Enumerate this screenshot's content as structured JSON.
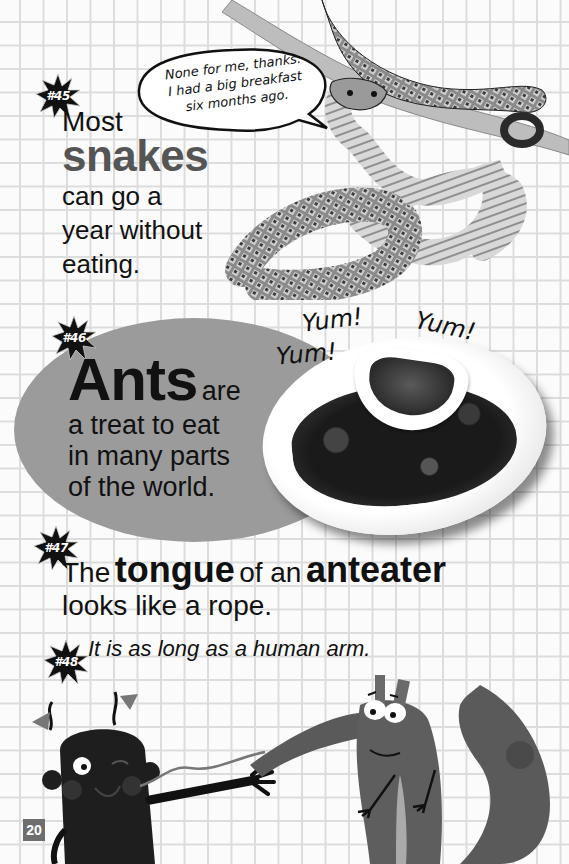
{
  "page": {
    "number": "20",
    "background": "grid-paper",
    "colors": {
      "grid_line": "#dcdcdc",
      "highlight_gray": "#555555",
      "ellipse_gray": "#9b9b9b",
      "badge": "#111111",
      "page_number_box": "#6e6e6e"
    }
  },
  "facts": [
    {
      "badge": "#45",
      "lines": {
        "line1": "Most",
        "highlight": "snakes",
        "line3": "can go a",
        "line4": "year without",
        "line5": "eating."
      },
      "speech_bubble": {
        "line1": "None for me, thanks.",
        "line2": "I had a big breakfast",
        "line3": "six months ago."
      },
      "image": "snake-coiled-on-branch"
    },
    {
      "badge": "#46",
      "highlight": "Ants",
      "after_highlight": "are",
      "line2": "a treat to eat",
      "line3": "in many parts",
      "line4": "of the world.",
      "exclamations": [
        "Yum!",
        "Yum!",
        "Yum!"
      ],
      "image": "plate-of-fried-ants-with-dipping-sauce"
    },
    {
      "badge": "#47",
      "part1": "The",
      "highlight1": "tongue",
      "part2": "of an",
      "highlight2": "anteater",
      "line2": "looks like a rope."
    },
    {
      "badge": "#48",
      "text": "It is as long as a human arm.",
      "image": "cartoon-kid-and-anteater-with-long-tongue"
    }
  ]
}
